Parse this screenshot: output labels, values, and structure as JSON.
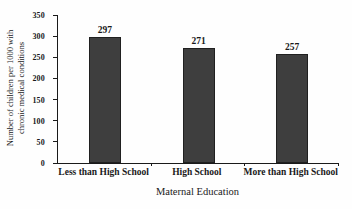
{
  "chart_data": {
    "type": "bar",
    "title": "",
    "categories": [
      "Less than High School",
      "High School",
      "More than High School"
    ],
    "values": [
      297,
      271,
      257
    ],
    "bar_labels": [
      "297",
      "271",
      "257"
    ],
    "xlabel": "Maternal Education",
    "ylabel": "Number of children per 1000 with chronic medical conditions",
    "ylabel_lines": [
      "Number of children per 1000 with",
      "chronic medical conditions"
    ],
    "ylim": [
      0,
      350
    ],
    "yticks": [
      0,
      50,
      100,
      150,
      200,
      250,
      300,
      350
    ],
    "grid": false,
    "legend": "none",
    "bar_color": "#3e3e3e",
    "bar_border_color": "#202020",
    "axis_color": "#1a1a1a",
    "text_color": "#1a1a1a",
    "background_color": "#ffffff"
  }
}
